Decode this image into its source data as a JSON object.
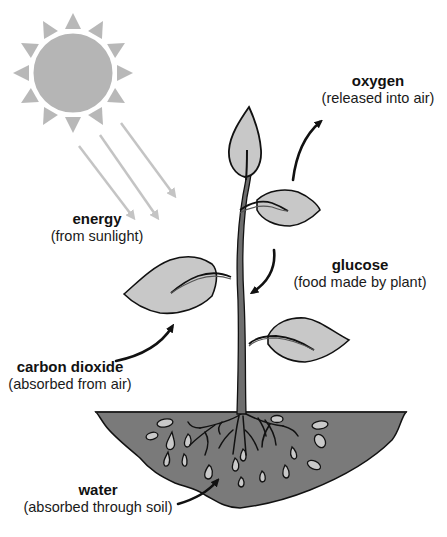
{
  "diagram": {
    "type": "photosynthesis",
    "colors": {
      "sun_fill": "#b5b5b5",
      "sun_rays": "#b8b8b8",
      "light_arrows": "#c4c4c4",
      "leaf_fill": "#c8c8c8",
      "outline": "#111111",
      "stem_fill": "#6e6e6e",
      "soil_fill": "#7a7a7a",
      "droplet_fill": "#c9c9c9",
      "arrow": "#111111"
    }
  },
  "labels": {
    "energy": {
      "title": "energy",
      "sub": "(from sunlight)"
    },
    "oxygen": {
      "title": "oxygen",
      "sub": "(released into air)"
    },
    "glucose": {
      "title": "glucose",
      "sub": "(food made by plant)"
    },
    "carbon_dioxide": {
      "title": "carbon dioxide",
      "sub": "(absorbed from air)"
    },
    "water": {
      "title": "water",
      "sub": "(absorbed through soil)"
    }
  },
  "icons": {
    "sun": "sun-icon",
    "plant": "plant-icon",
    "soil": "soil-icon"
  }
}
